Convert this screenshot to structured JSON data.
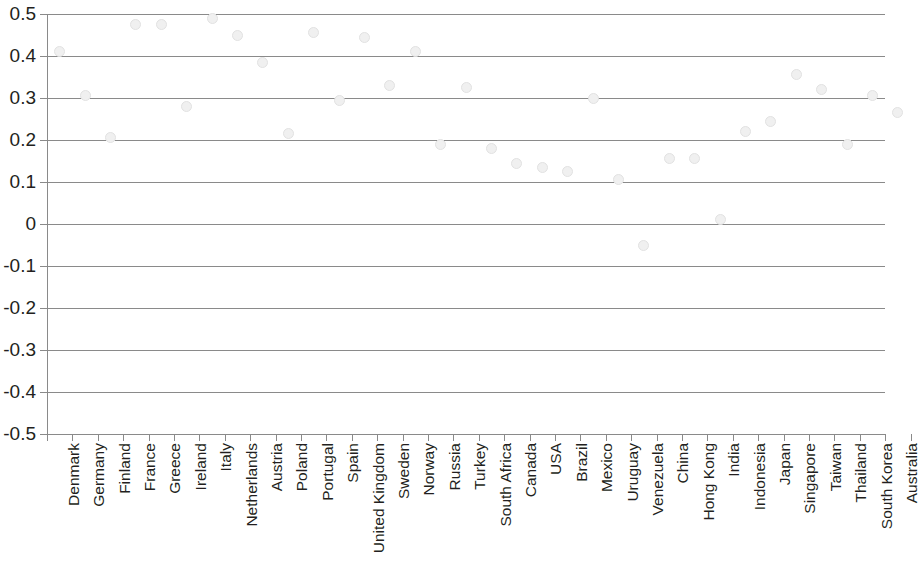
{
  "chart_data": {
    "type": "scatter",
    "title": "",
    "subtitle": "",
    "xlabel": "",
    "ylabel": "",
    "ylim": [
      -0.5,
      0.5
    ],
    "ytick_step": 0.1,
    "grid": true,
    "legend": null,
    "marker_color": "#f0f0f0",
    "marker_edge_color": "#e2e2e2",
    "axis_color": "#8a8a8a",
    "text_color": "#231f20",
    "ytick_labels": [
      "0.5",
      "0.4",
      "0.3",
      "0.2",
      "0.1",
      "0",
      "-0.1",
      "-0.2",
      "-0.3",
      "-0.4",
      "-0.5"
    ],
    "ytick_values": [
      0.5,
      0.4,
      0.3,
      0.2,
      0.1,
      0,
      -0.1,
      -0.2,
      -0.3,
      -0.4,
      -0.5
    ],
    "categories": [
      "Denmark",
      "Germany",
      "Finland",
      "France",
      "Greece",
      "Ireland",
      "Italy",
      "Netherlands",
      "Austria",
      "Poland",
      "Portugal",
      "Spain",
      "United Kingdom",
      "Sweden",
      "Norway",
      "Russia",
      "Turkey",
      "South Africa",
      "Canada",
      "USA",
      "Brazil",
      "Mexico",
      "Uruguay",
      "Venezuela",
      "China",
      "Hong Kong",
      "India",
      "Indonesia",
      "Japan",
      "Singapore",
      "Taiwan",
      "Thailand",
      "South Korea",
      "Australia"
    ],
    "values": [
      0.41,
      0.305,
      0.205,
      0.475,
      0.475,
      0.28,
      0.49,
      0.45,
      0.385,
      0.215,
      0.455,
      0.295,
      0.445,
      0.33,
      0.41,
      0.19,
      0.325,
      0.18,
      0.145,
      0.135,
      0.125,
      0.3,
      0.105,
      -0.05,
      0.155,
      0.155,
      0.01,
      0.22,
      0.245,
      0.355,
      0.32,
      0.19,
      0.305,
      0.265
    ]
  }
}
